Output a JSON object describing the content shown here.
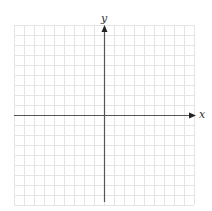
{
  "diagram": {
    "type": "coordinate-grid",
    "x_axis_label": "x",
    "y_axis_label": "y",
    "grid": {
      "columns": 18,
      "rows": 18,
      "cell_px": 10
    },
    "colors": {
      "grid": "#e4e4e4",
      "axis": "#555555",
      "background": "#ffffff"
    }
  }
}
